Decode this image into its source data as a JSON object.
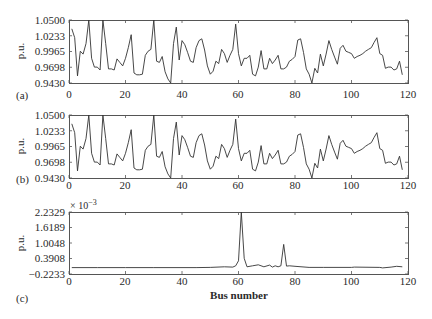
{
  "figure": {
    "panels": [
      {
        "label": "(a)",
        "ylabel": "p.u.",
        "yticks": [
          "1.0500",
          "1.0233",
          "0.9965",
          "0.9698",
          "0.9430"
        ],
        "xticks": [
          "0",
          "20",
          "40",
          "60",
          "80",
          "100",
          "120"
        ]
      },
      {
        "label": "(b)",
        "ylabel": "p.u.",
        "yticks": [
          "1.0500",
          "1.0233",
          "0.9965",
          "0.9698",
          "0.9430"
        ],
        "xticks": [
          "0",
          "20",
          "40",
          "60",
          "80",
          "100",
          "120"
        ]
      },
      {
        "label": "(c)",
        "ylabel": "p.u.",
        "exponent": "× 10",
        "exponent_power": "−3",
        "yticks": [
          "2.2329",
          "1.6189",
          "1.0048",
          "0.3908",
          "−0.2233"
        ],
        "xticks": [
          "0",
          "20",
          "40",
          "60",
          "80",
          "100",
          "120"
        ]
      }
    ],
    "xlabel": "Bus number"
  },
  "chart_data": [
    {
      "type": "line",
      "title": "(a)",
      "xlabel": "",
      "ylabel": "p.u.",
      "xlim": [
        0,
        120
      ],
      "ylim": [
        0.943,
        1.05
      ],
      "grid": false,
      "x": [
        1,
        2,
        3,
        4,
        5,
        6,
        7,
        8,
        9,
        10,
        11,
        12,
        13,
        14,
        15,
        16,
        17,
        18,
        19,
        20,
        21,
        22,
        23,
        24,
        25,
        26,
        27,
        28,
        29,
        30,
        31,
        32,
        33,
        34,
        35,
        36,
        37,
        38,
        39,
        40,
        41,
        42,
        43,
        44,
        45,
        46,
        47,
        48,
        49,
        50,
        51,
        52,
        53,
        54,
        55,
        56,
        57,
        58,
        59,
        60,
        61,
        62,
        63,
        64,
        65,
        66,
        67,
        68,
        69,
        70,
        71,
        72,
        73,
        74,
        75,
        76,
        77,
        78,
        79,
        80,
        81,
        82,
        83,
        84,
        85,
        86,
        87,
        88,
        89,
        90,
        91,
        92,
        93,
        94,
        95,
        96,
        97,
        98,
        99,
        100,
        101,
        102,
        103,
        104,
        105,
        106,
        107,
        108,
        109,
        110,
        111,
        112,
        113,
        114,
        115,
        116,
        117,
        118
      ],
      "series": [
        {
          "name": "voltage",
          "values": [
            1.035,
            1.02,
            0.955,
            0.997,
            0.992,
            1.01,
            1.05,
            0.985,
            0.97,
            0.97,
            0.965,
            1.05,
            1.01,
            0.967,
            0.967,
            0.965,
            0.984,
            0.978,
            0.972,
            0.985,
            1.003,
            1.025,
            0.96,
            0.957,
            0.957,
            0.958,
            0.99,
            0.997,
            1.0,
            1.05,
            0.98,
            0.978,
            0.988,
            0.962,
            0.95,
            0.943,
            1.01,
            1.038,
            0.982,
            1.015,
            1.008,
            0.995,
            0.98,
            0.978,
            1.003,
            1.015,
            1.018,
            0.999,
            0.972,
            0.958,
            0.963,
            0.98,
            0.976,
            1.0,
            0.993,
            0.978,
            0.99,
            1.0,
            1.043,
            0.993,
            0.972,
            0.985,
            0.985,
            0.99,
            0.958,
            0.955,
            0.97,
            0.998,
            0.967,
            0.967,
            0.985,
            0.976,
            0.982,
            0.99,
            0.967,
            0.967,
            0.97,
            0.98,
            0.983,
            0.988,
            1.016,
            1.018,
            0.995,
            0.967,
            0.958,
            0.943,
            0.968,
            0.96,
            0.992,
            0.972,
            0.992,
            1.015,
            1.0,
            0.987,
            0.975,
            1.002,
            1.007,
            0.997,
            0.995,
            0.993,
            0.985,
            0.988,
            0.99,
            0.993,
            0.997,
            1.0,
            1.003,
            1.012,
            1.02,
            0.993,
            0.99,
            0.968,
            0.97,
            0.97,
            0.965,
            0.967,
            0.98,
            0.957
          ]
        }
      ]
    },
    {
      "type": "line",
      "title": "(b)",
      "xlabel": "",
      "ylabel": "p.u.",
      "xlim": [
        0,
        120
      ],
      "ylim": [
        0.943,
        1.05
      ],
      "grid": false,
      "x": [
        1,
        2,
        3,
        4,
        5,
        6,
        7,
        8,
        9,
        10,
        11,
        12,
        13,
        14,
        15,
        16,
        17,
        18,
        19,
        20,
        21,
        22,
        23,
        24,
        25,
        26,
        27,
        28,
        29,
        30,
        31,
        32,
        33,
        34,
        35,
        36,
        37,
        38,
        39,
        40,
        41,
        42,
        43,
        44,
        45,
        46,
        47,
        48,
        49,
        50,
        51,
        52,
        53,
        54,
        55,
        56,
        57,
        58,
        59,
        60,
        61,
        62,
        63,
        64,
        65,
        66,
        67,
        68,
        69,
        70,
        71,
        72,
        73,
        74,
        75,
        76,
        77,
        78,
        79,
        80,
        81,
        82,
        83,
        84,
        85,
        86,
        87,
        88,
        89,
        90,
        91,
        92,
        93,
        94,
        95,
        96,
        97,
        98,
        99,
        100,
        101,
        102,
        103,
        104,
        105,
        106,
        107,
        108,
        109,
        110,
        111,
        112,
        113,
        114,
        115,
        116,
        117,
        118
      ],
      "series": [
        {
          "name": "voltage",
          "values": [
            1.035,
            1.02,
            0.955,
            0.997,
            0.992,
            1.01,
            1.05,
            0.985,
            0.97,
            0.97,
            0.965,
            1.05,
            1.01,
            0.967,
            0.967,
            0.965,
            0.984,
            0.978,
            0.972,
            0.985,
            1.003,
            1.025,
            0.96,
            0.957,
            0.957,
            0.958,
            0.99,
            0.997,
            1.0,
            1.05,
            0.98,
            0.978,
            0.988,
            0.962,
            0.95,
            0.943,
            1.01,
            1.038,
            0.982,
            1.015,
            1.008,
            0.995,
            0.98,
            0.978,
            1.003,
            1.015,
            1.018,
            0.999,
            0.972,
            0.958,
            0.963,
            0.98,
            0.976,
            1.0,
            0.993,
            0.978,
            0.99,
            1.0,
            1.043,
            0.993,
            0.972,
            0.985,
            0.985,
            0.99,
            0.958,
            0.955,
            0.97,
            0.998,
            0.967,
            0.967,
            0.985,
            0.976,
            0.982,
            0.99,
            0.967,
            0.967,
            0.97,
            0.98,
            0.983,
            0.988,
            1.016,
            1.018,
            0.995,
            0.967,
            0.958,
            0.943,
            0.968,
            0.96,
            0.992,
            0.972,
            0.992,
            1.015,
            1.0,
            0.987,
            0.975,
            1.002,
            1.007,
            0.997,
            0.995,
            0.993,
            0.985,
            0.988,
            0.99,
            0.993,
            0.997,
            1.0,
            1.003,
            1.012,
            1.02,
            0.993,
            0.99,
            0.968,
            0.97,
            0.97,
            0.965,
            0.967,
            0.98,
            0.957
          ]
        }
      ]
    },
    {
      "type": "line",
      "title": "(c)",
      "xlabel": "Bus number",
      "ylabel": "p.u. (× 10^-3)",
      "xlim": [
        0,
        120
      ],
      "ylim": [
        -0.2233,
        2.2329
      ],
      "grid": false,
      "x": [
        1,
        10,
        20,
        30,
        40,
        45,
        50,
        55,
        58,
        59,
        60,
        61,
        62,
        63,
        65,
        67,
        69,
        71,
        72,
        73,
        74,
        75,
        76,
        77,
        78,
        80,
        85,
        90,
        100,
        101,
        110,
        111,
        114,
        116,
        118
      ],
      "series": [
        {
          "name": "difference",
          "values": [
            0.03,
            0.03,
            0.03,
            0.03,
            0.03,
            0.03,
            0.04,
            0.06,
            0.05,
            0.1,
            0.3,
            2.23,
            0.4,
            0.06,
            0.1,
            0.14,
            0.06,
            0.13,
            0.05,
            0.1,
            0.06,
            0.1,
            0.95,
            0.09,
            0.1,
            0.08,
            0.04,
            0.04,
            0.04,
            0.05,
            0.04,
            0.02,
            0.05,
            0.08,
            0.06
          ]
        }
      ]
    }
  ]
}
